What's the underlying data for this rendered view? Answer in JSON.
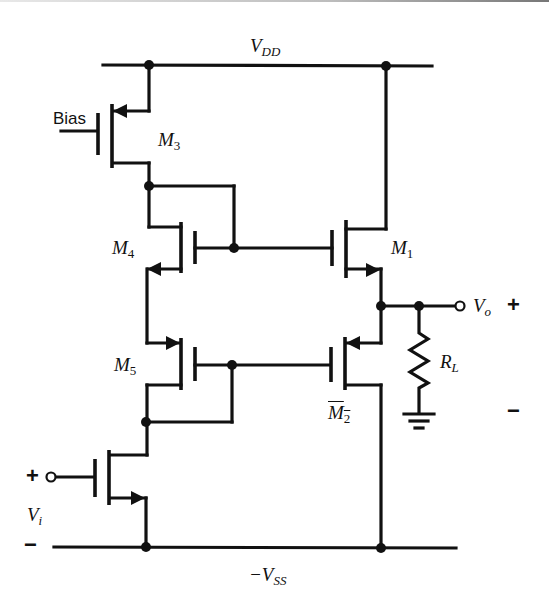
{
  "diagram": {
    "type": "circuit-schematic",
    "rails": {
      "top": {
        "name": "V",
        "sub": "DD"
      },
      "bottom": {
        "name": "−V",
        "sub": "SS"
      }
    },
    "transistors": [
      {
        "id": "M3",
        "name": "M",
        "sub": "3",
        "role": "bias current source (PMOS)",
        "gate_label": "Bias"
      },
      {
        "id": "M4",
        "name": "M",
        "sub": "4",
        "role": "level shift (diode-connected drive for M1)"
      },
      {
        "id": "M5",
        "name": "M",
        "sub": "5",
        "role": "level shift (diode-connected drive for M2)"
      },
      {
        "id": "M1",
        "name": "M",
        "sub": "1",
        "role": "upper output source follower"
      },
      {
        "id": "M2",
        "name": "M",
        "sub": "2",
        "role": "lower output source follower"
      },
      {
        "id": "Min",
        "name": "",
        "sub": "",
        "role": "input transistor driven by Vi"
      }
    ],
    "load": {
      "name": "R",
      "sub": "L"
    },
    "input": {
      "name": "V",
      "sub": "i",
      "plus": "+",
      "minus": "−"
    },
    "output": {
      "name": "V",
      "sub": "o",
      "plus": "+",
      "minus": "−"
    },
    "bias_label": "Bias"
  }
}
